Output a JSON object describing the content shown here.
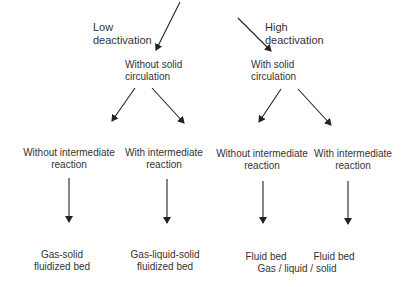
{
  "diagram": {
    "top_labels": {
      "left": [
        "Low",
        "deactivation"
      ],
      "right": [
        "High",
        "deactivation"
      ]
    },
    "level2": {
      "left": [
        "Without solid",
        "circulation"
      ],
      "right": [
        "With solid",
        "circulation"
      ]
    },
    "level3": [
      [
        "Without intermediate",
        "reaction"
      ],
      [
        "With intermediate",
        "reaction"
      ],
      [
        "Without intermediate",
        "reaction"
      ],
      [
        "With intermediate",
        "reaction"
      ]
    ],
    "level4": [
      [
        "Gas-solid",
        "fluidized bed"
      ],
      [
        "Gas-liquid-solid",
        "fluidized bed"
      ],
      [
        "Fluid bed"
      ],
      [
        "Fluid bed"
      ]
    ],
    "footer_note": "Gas / liquid / solid",
    "colors": {
      "text": "#333333",
      "arrow": "#222222",
      "background": "#ffffff"
    }
  }
}
